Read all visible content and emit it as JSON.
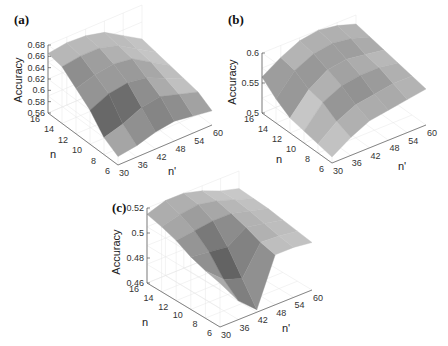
{
  "chart_data": [
    {
      "panel": "(a)",
      "type": "surface",
      "xlabel": "n'",
      "ylabel": "n",
      "zlabel": "Accuracy",
      "x_ticks": [
        "30",
        "36",
        "42",
        "48",
        "54",
        "60"
      ],
      "y_ticks": [
        "6",
        "8",
        "10",
        "12",
        "14",
        "16"
      ],
      "z_ticks": [
        "0.56",
        "0.58",
        "0.6",
        "0.62",
        "0.64",
        "0.66",
        "0.68"
      ],
      "zlim": [
        0.56,
        0.68
      ],
      "x": [
        30,
        36,
        42,
        48,
        54,
        60
      ],
      "y": [
        6,
        8,
        10,
        12,
        14,
        16
      ],
      "z": [
        [
          0.575,
          0.58,
          0.59,
          0.595,
          0.59,
          0.585
        ],
        [
          0.59,
          0.6,
          0.615,
          0.62,
          0.61,
          0.6
        ],
        [
          0.62,
          0.635,
          0.64,
          0.635,
          0.62,
          0.605
        ],
        [
          0.64,
          0.65,
          0.655,
          0.65,
          0.63,
          0.61
        ],
        [
          0.66,
          0.665,
          0.665,
          0.655,
          0.635,
          0.615
        ],
        [
          0.665,
          0.67,
          0.668,
          0.66,
          0.64,
          0.62
        ]
      ]
    },
    {
      "panel": "(b)",
      "type": "surface",
      "xlabel": "n'",
      "ylabel": "n",
      "zlabel": "Accuracy",
      "x_ticks": [
        "30",
        "36",
        "42",
        "48",
        "54",
        "60"
      ],
      "y_ticks": [
        "6",
        "8",
        "10",
        "12",
        "14",
        "16"
      ],
      "z_ticks": [
        "0.5",
        "0.55",
        "0.6"
      ],
      "zlim": [
        0.5,
        0.6
      ],
      "x": [
        30,
        36,
        42,
        48,
        54,
        60
      ],
      "y": [
        6,
        8,
        10,
        12,
        14,
        16
      ],
      "z": [
        [
          0.51,
          0.53,
          0.545,
          0.55,
          0.555,
          0.56
        ],
        [
          0.515,
          0.54,
          0.555,
          0.56,
          0.565,
          0.565
        ],
        [
          0.52,
          0.555,
          0.57,
          0.575,
          0.575,
          0.57
        ],
        [
          0.525,
          0.56,
          0.58,
          0.585,
          0.58,
          0.575
        ],
        [
          0.54,
          0.575,
          0.59,
          0.595,
          0.59,
          0.58
        ],
        [
          0.56,
          0.58,
          0.595,
          0.6,
          0.595,
          0.585
        ]
      ]
    },
    {
      "panel": "(c)",
      "type": "surface",
      "xlabel": "n'",
      "ylabel": "n",
      "zlabel": "Accuracy",
      "x_ticks": [
        "30",
        "36",
        "42",
        "48",
        "54",
        "60"
      ],
      "y_ticks": [
        "6",
        "8",
        "10",
        "12",
        "14",
        "16"
      ],
      "z_ticks": [
        "0.46",
        "0.48",
        "0.5",
        "0.52"
      ],
      "zlim": [
        0.46,
        0.52
      ],
      "x": [
        30,
        36,
        42,
        48,
        54,
        60
      ],
      "y": [
        6,
        8,
        10,
        12,
        14,
        16
      ],
      "z": [
        [
          0.495,
          0.475,
          0.462,
          0.5,
          0.5,
          0.498
        ],
        [
          0.498,
          0.485,
          0.48,
          0.503,
          0.502,
          0.5
        ],
        [
          0.502,
          0.5,
          0.498,
          0.508,
          0.505,
          0.502
        ],
        [
          0.508,
          0.51,
          0.512,
          0.512,
          0.508,
          0.504
        ],
        [
          0.512,
          0.516,
          0.518,
          0.515,
          0.51,
          0.505
        ],
        [
          0.515,
          0.52,
          0.52,
          0.516,
          0.51,
          0.506
        ]
      ]
    }
  ],
  "panels": {
    "a": {
      "label": "(a)",
      "zlabel": "Accuracy",
      "xlabel": "n'",
      "ylabel": "n"
    },
    "b": {
      "label": "(b)",
      "zlabel": "Accuracy",
      "xlabel": "n'",
      "ylabel": "n"
    },
    "c": {
      "label": "(c)",
      "zlabel": "Accuracy",
      "xlabel": "n'",
      "ylabel": "n"
    }
  },
  "colors": {
    "surface_dark": "#3a3a3a",
    "surface_light": "#f2f2f2",
    "axis": "#555555",
    "grid": "#e6e6e6"
  }
}
